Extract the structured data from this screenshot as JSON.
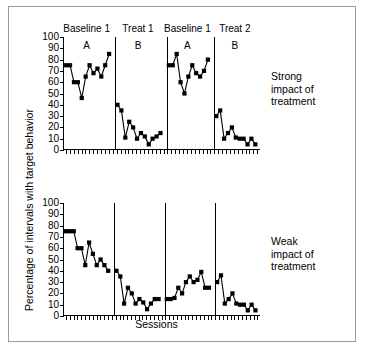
{
  "figure": {
    "background_color": "#ffffff",
    "border_color": "#9a9a9a",
    "ink_color": "#000000"
  },
  "axes": {
    "ylabel": "Percentage of intervals with target behavior",
    "xlabel": "Sessions",
    "yticks": [
      0,
      10,
      20,
      30,
      40,
      50,
      60,
      70,
      80,
      90,
      100
    ],
    "ylim": [
      0,
      100
    ]
  },
  "phase_headers": [
    {
      "label": "Baseline 1",
      "sub": "A"
    },
    {
      "label": "Treat 1",
      "sub": "B"
    },
    {
      "label": "Baseline 1",
      "sub": "A"
    },
    {
      "label": "Treat 2",
      "sub": "B"
    }
  ],
  "side_notes": {
    "top": "Strong\nimpact of\ntreatment",
    "bottom": "Weak\nimpact of\ntreatment"
  },
  "chart_data": [
    {
      "type": "line",
      "title": "Strong impact of treatment",
      "panel": "top",
      "xlabel": "Sessions",
      "ylabel": "Percentage of intervals with target behavior",
      "ylim": [
        0,
        100
      ],
      "yticks": [
        0,
        10,
        20,
        30,
        40,
        50,
        60,
        70,
        80,
        90,
        100
      ],
      "grid": false,
      "legend": false,
      "marker": "filled-square",
      "design": "ABAB reversal",
      "phases": [
        {
          "name": "Baseline 1",
          "condition": "A",
          "x": [
            1,
            2,
            3,
            4,
            5,
            6,
            7,
            8,
            9,
            10,
            11,
            12
          ],
          "values": [
            75,
            75,
            60,
            60,
            46,
            65,
            75,
            68,
            72,
            65,
            75,
            85
          ]
        },
        {
          "name": "Treat 1",
          "condition": "B",
          "x": [
            13,
            14,
            15,
            16,
            17,
            18,
            19,
            20,
            21,
            22,
            23,
            24
          ],
          "values": [
            40,
            35,
            11,
            25,
            20,
            10,
            15,
            12,
            5,
            10,
            12,
            15
          ]
        },
        {
          "name": "Baseline 1",
          "condition": "A",
          "x": [
            25,
            26,
            27,
            28,
            29,
            30,
            31,
            32,
            33,
            34,
            35
          ],
          "values": [
            75,
            75,
            85,
            60,
            50,
            65,
            75,
            68,
            65,
            70,
            80
          ]
        },
        {
          "name": "Treat 2",
          "condition": "B",
          "x": [
            36,
            37,
            38,
            39,
            40,
            41,
            42,
            43,
            44,
            45,
            46
          ],
          "values": [
            30,
            35,
            10,
            15,
            20,
            11,
            10,
            10,
            5,
            10,
            5
          ]
        }
      ]
    },
    {
      "type": "line",
      "title": "Weak impact of treatment",
      "panel": "bottom",
      "xlabel": "Sessions",
      "ylabel": "Percentage of intervals with target behavior",
      "ylim": [
        0,
        100
      ],
      "yticks": [
        0,
        10,
        20,
        30,
        40,
        50,
        60,
        70,
        80,
        90,
        100
      ],
      "grid": false,
      "legend": false,
      "marker": "filled-square",
      "design": "ABAB reversal",
      "phases": [
        {
          "name": "Baseline 1",
          "condition": "A",
          "x": [
            1,
            2,
            3,
            4,
            5,
            6,
            7,
            8,
            9,
            10,
            11,
            12
          ],
          "values": [
            75,
            75,
            75,
            60,
            60,
            45,
            65,
            55,
            45,
            50,
            45,
            40
          ]
        },
        {
          "name": "Treat 1",
          "condition": "B",
          "x": [
            13,
            14,
            15,
            16,
            17,
            18,
            19,
            20,
            21,
            22,
            23,
            24
          ],
          "values": [
            40,
            35,
            11,
            25,
            20,
            11,
            15,
            12,
            6,
            11,
            15,
            15
          ]
        },
        {
          "name": "Baseline 1",
          "condition": "A",
          "x": [
            25,
            26,
            27,
            28,
            29,
            30,
            31,
            32,
            33,
            34,
            35
          ],
          "values": [
            15,
            15,
            16,
            25,
            20,
            30,
            35,
            30,
            32,
            39,
            25,
            25
          ]
        },
        {
          "name": "Treat 2",
          "condition": "B",
          "x": [
            36,
            37,
            38,
            39,
            40,
            41,
            42,
            43,
            44,
            45,
            46
          ],
          "values": [
            30,
            36,
            11,
            15,
            20,
            11,
            10,
            10,
            5,
            10,
            5
          ]
        }
      ]
    }
  ]
}
